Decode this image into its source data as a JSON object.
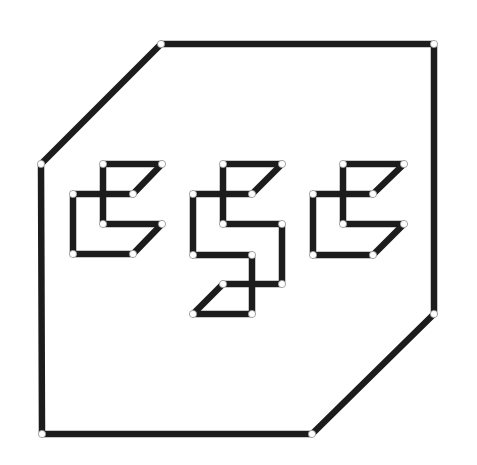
{
  "diagram": {
    "type": "node-edge line drawing",
    "width": 477,
    "height": 465,
    "colors": {
      "background": "#ffffff",
      "stroke": "#1c1c1c",
      "node_fill": "#ffffff",
      "node_outline": "#9a9a9a"
    },
    "stroke_width": 6.5,
    "node_radius": 3.6,
    "outer_polygon": {
      "nodes": [
        {
          "id": "o1",
          "x": 161,
          "y": 44
        },
        {
          "id": "o2",
          "x": 434,
          "y": 44
        },
        {
          "id": "o3",
          "x": 434,
          "y": 314
        },
        {
          "id": "o4",
          "x": 312,
          "y": 434
        },
        {
          "id": "o5",
          "x": 42,
          "y": 434
        },
        {
          "id": "o6",
          "x": 41,
          "y": 164
        }
      ],
      "edges": [
        [
          "o1",
          "o2"
        ],
        [
          "o2",
          "o3"
        ],
        [
          "o3",
          "o4"
        ],
        [
          "o4",
          "o5"
        ],
        [
          "o5",
          "o6"
        ],
        [
          "o6",
          "o1"
        ]
      ]
    },
    "glyphs": [
      {
        "name": "left-glyph",
        "nodes": [
          {
            "id": "a",
            "x": 103,
            "y": 164
          },
          {
            "id": "b",
            "x": 162,
            "y": 164
          },
          {
            "id": "c",
            "x": 73,
            "y": 194
          },
          {
            "id": "d",
            "x": 133,
            "y": 194
          },
          {
            "id": "e",
            "x": 103,
            "y": 224
          },
          {
            "id": "f",
            "x": 162,
            "y": 224
          },
          {
            "id": "g",
            "x": 73,
            "y": 254
          },
          {
            "id": "h",
            "x": 133,
            "y": 254
          }
        ],
        "edges": [
          [
            "a",
            "b"
          ],
          [
            "b",
            "d"
          ],
          [
            "c",
            "d"
          ],
          [
            "a",
            "e"
          ],
          [
            "e",
            "f"
          ],
          [
            "f",
            "h"
          ],
          [
            "c",
            "g"
          ],
          [
            "g",
            "h"
          ]
        ]
      },
      {
        "name": "middle-glyph",
        "nodes": [
          {
            "id": "a",
            "x": 223,
            "y": 164
          },
          {
            "id": "b",
            "x": 282,
            "y": 164
          },
          {
            "id": "c",
            "x": 193,
            "y": 194
          },
          {
            "id": "d",
            "x": 252,
            "y": 194
          },
          {
            "id": "e",
            "x": 223,
            "y": 224
          },
          {
            "id": "f",
            "x": 282,
            "y": 224
          },
          {
            "id": "g",
            "x": 193,
            "y": 255
          },
          {
            "id": "h",
            "x": 252,
            "y": 255
          },
          {
            "id": "i",
            "x": 223,
            "y": 284
          },
          {
            "id": "j",
            "x": 282,
            "y": 284
          },
          {
            "id": "k",
            "x": 193,
            "y": 314
          },
          {
            "id": "l",
            "x": 252,
            "y": 314
          }
        ],
        "edges": [
          [
            "a",
            "b"
          ],
          [
            "b",
            "d"
          ],
          [
            "c",
            "d"
          ],
          [
            "a",
            "e"
          ],
          [
            "e",
            "f"
          ],
          [
            "f",
            "j"
          ],
          [
            "c",
            "g"
          ],
          [
            "g",
            "h"
          ],
          [
            "h",
            "l"
          ],
          [
            "i",
            "j"
          ],
          [
            "i",
            "k"
          ],
          [
            "k",
            "l"
          ]
        ]
      },
      {
        "name": "right-glyph",
        "nodes": [
          {
            "id": "a",
            "x": 343,
            "y": 164
          },
          {
            "id": "b",
            "x": 404,
            "y": 164
          },
          {
            "id": "c",
            "x": 313,
            "y": 194
          },
          {
            "id": "d",
            "x": 373,
            "y": 194
          },
          {
            "id": "e",
            "x": 343,
            "y": 224
          },
          {
            "id": "f",
            "x": 404,
            "y": 224
          },
          {
            "id": "g",
            "x": 313,
            "y": 255
          },
          {
            "id": "h",
            "x": 373,
            "y": 255
          }
        ],
        "edges": [
          [
            "a",
            "b"
          ],
          [
            "b",
            "d"
          ],
          [
            "c",
            "d"
          ],
          [
            "a",
            "e"
          ],
          [
            "e",
            "f"
          ],
          [
            "f",
            "h"
          ],
          [
            "c",
            "g"
          ],
          [
            "g",
            "h"
          ]
        ]
      }
    ]
  }
}
